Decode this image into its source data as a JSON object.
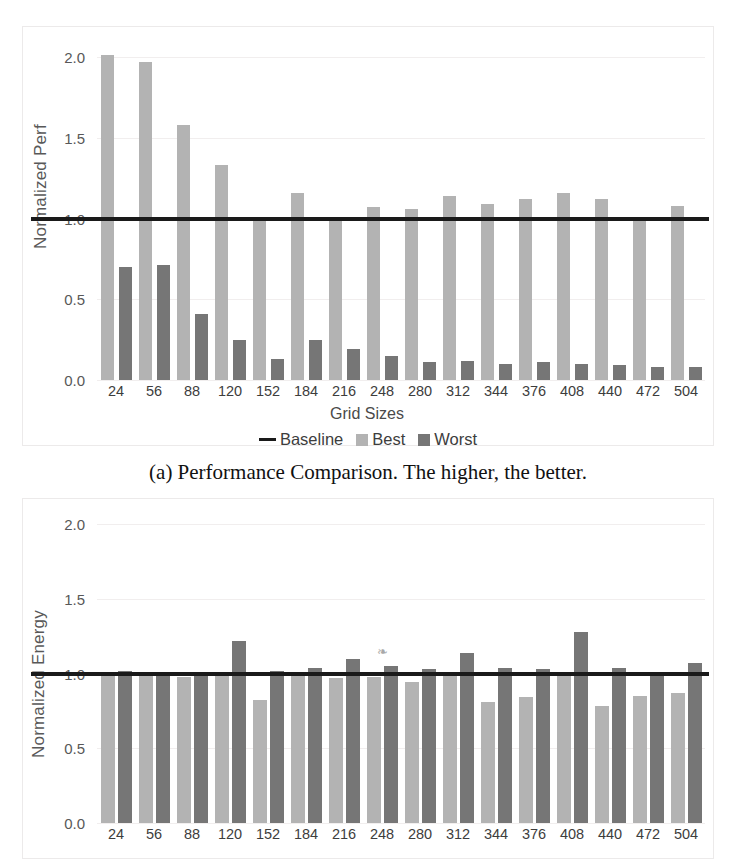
{
  "page": {
    "width": 736,
    "height": 859,
    "background": "#ffffff"
  },
  "colors": {
    "best": "#b3b3b3",
    "worst": "#767676",
    "baseline": "#1a1a1a",
    "grid": "#f1eeee",
    "frame": "#eceaea",
    "tick_text": "#585858"
  },
  "figure_a": {
    "caption": "(a) Performance Comparison. The higher, the better.",
    "xaxis_title": "Grid Sizes",
    "legend": [
      {
        "label": "Baseline",
        "marker": "line-swatch"
      },
      {
        "label": "Best",
        "marker": "square-swatch"
      },
      {
        "label": "Worst",
        "marker": "square-swatch"
      }
    ]
  },
  "figure_b": {
    "xaxis_title": "",
    "smudge_glyph": "❧"
  },
  "chart_data": [
    {
      "id": "performance",
      "type": "bar",
      "title": "",
      "caption": "(a) Performance Comparison. The higher, the better.",
      "xlabel": "Grid Sizes",
      "ylabel": "Normalized Perf",
      "ylim": [
        0.0,
        2.0
      ],
      "yticks": [
        0.0,
        0.5,
        1.0,
        1.5,
        2.0
      ],
      "ytick_labels": [
        "0.0",
        "0.5",
        "1.0",
        "1.5",
        "2.0"
      ],
      "grid": true,
      "legend_position": "bottom-center",
      "categories": [
        "24",
        "56",
        "88",
        "120",
        "152",
        "184",
        "216",
        "248",
        "280",
        "312",
        "344",
        "376",
        "408",
        "440",
        "472",
        "504"
      ],
      "series": [
        {
          "name": "Best",
          "color": "#b3b3b3",
          "values": [
            2.01,
            1.97,
            1.58,
            1.33,
            1.0,
            1.16,
            1.0,
            1.07,
            1.06,
            1.14,
            1.09,
            1.12,
            1.16,
            1.12,
            1.0,
            1.08
          ]
        },
        {
          "name": "Worst",
          "color": "#767676",
          "values": [
            0.7,
            0.71,
            0.41,
            0.25,
            0.13,
            0.25,
            0.19,
            0.15,
            0.11,
            0.12,
            0.1,
            0.11,
            0.1,
            0.09,
            0.08,
            0.08
          ]
        }
      ],
      "reference_line": {
        "name": "Baseline",
        "value": 1.0,
        "color": "#1a1a1a"
      }
    },
    {
      "id": "energy",
      "type": "bar",
      "title": "",
      "caption": "",
      "xlabel": "",
      "ylabel": "Normalized Energy",
      "ylim": [
        0.0,
        2.0
      ],
      "yticks": [
        0.0,
        0.5,
        1.0,
        1.5,
        2.0
      ],
      "ytick_labels": [
        "0.0",
        "0.5",
        "1.0",
        "1.5",
        "2.0"
      ],
      "grid": true,
      "legend_position": "none",
      "categories": [
        "24",
        "56",
        "88",
        "120",
        "152",
        "184",
        "216",
        "248",
        "280",
        "312",
        "344",
        "376",
        "408",
        "440",
        "472",
        "504"
      ],
      "series": [
        {
          "name": "Best",
          "color": "#b3b3b3",
          "values": [
            1.0,
            0.99,
            0.98,
            1.0,
            0.82,
            0.99,
            0.97,
            0.98,
            0.94,
            0.99,
            0.81,
            0.84,
            0.99,
            0.78,
            0.85,
            0.87
          ]
        },
        {
          "name": "Worst",
          "color": "#767676",
          "values": [
            1.02,
            1.0,
            1.01,
            1.22,
            1.02,
            1.04,
            1.1,
            1.05,
            1.03,
            1.14,
            1.04,
            1.03,
            1.28,
            1.04,
            1.0,
            1.07
          ]
        }
      ],
      "reference_line": {
        "name": "Baseline",
        "value": 1.0,
        "color": "#1a1a1a"
      }
    }
  ]
}
